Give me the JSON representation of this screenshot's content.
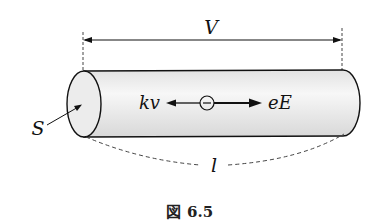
{
  "figure": {
    "caption_prefix": "図",
    "caption_number": "6.5",
    "labels": {
      "voltage": "V",
      "area": "S",
      "length": "l",
      "drag_force": "kv",
      "electric_force": "eE",
      "charge_symbol": "−"
    },
    "colors": {
      "stroke": "#111111",
      "cylinder_fill": "#e6e6e6",
      "cylinder_highlight": "#f6f6f6",
      "dash": "#444444"
    }
  }
}
